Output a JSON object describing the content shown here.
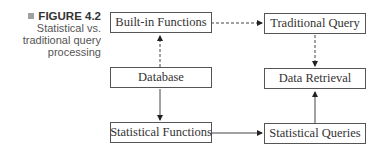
{
  "caption": {
    "figure_label": "FIGURE 4.2",
    "text_line1": "Statistical vs.",
    "text_line2": "traditional query",
    "text_line3": "processing"
  },
  "nodes": {
    "builtin": "Built-in Functions",
    "database": "Database",
    "stat_functions": "Statistical Functions",
    "traditional": "Traditional Query",
    "retrieval": "Data Retrieval",
    "stat_queries": "Statistical Queries"
  },
  "edges": [
    {
      "from": "Database",
      "to": "Built-in Functions",
      "style": "dashed"
    },
    {
      "from": "Built-in Functions",
      "to": "Traditional Query",
      "style": "dashed"
    },
    {
      "from": "Traditional Query",
      "to": "Data Retrieval",
      "style": "dashed"
    },
    {
      "from": "Database",
      "to": "Statistical Functions",
      "style": "solid"
    },
    {
      "from": "Statistical Functions",
      "to": "Statistical Queries",
      "style": "solid"
    },
    {
      "from": "Statistical Queries",
      "to": "Data Retrieval",
      "style": "solid"
    }
  ]
}
